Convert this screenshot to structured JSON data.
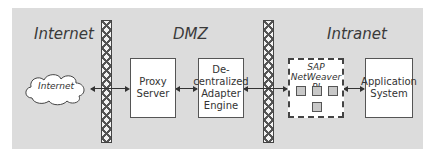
{
  "zones": {
    "internet": "Internet",
    "dmz": "DMZ",
    "intranet": "Intranet"
  },
  "nodes": {
    "cloud": "Internet",
    "proxy_line1": "Proxy",
    "proxy_line2": "Server",
    "dae_line1": "De-",
    "dae_line2": "centralized",
    "dae_line3": "Adapter",
    "dae_line4": "Engine",
    "pi_line1": "SAP",
    "pi_line2": "NetWeaver PI",
    "app_line1": "Application",
    "app_line2": "System"
  }
}
